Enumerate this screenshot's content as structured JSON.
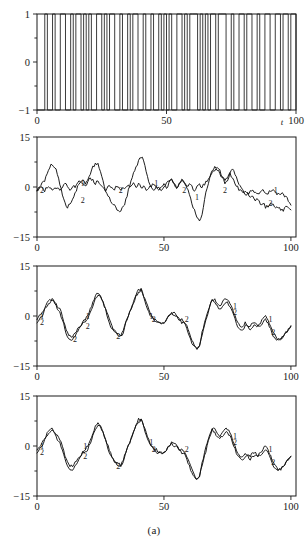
{
  "caption": "(a)",
  "chart_data": [
    {
      "panel": "top",
      "type": "line",
      "title": "",
      "xlabel": "t",
      "ylabel": "",
      "xlim": [
        0,
        100
      ],
      "ylim": [
        -1,
        1
      ],
      "xticks": [
        0,
        50,
        100
      ],
      "xticklabels": [
        "0",
        "50",
        "100"
      ],
      "yticks": [
        -1,
        0,
        1
      ],
      "yticklabels": [
        "-1",
        "0",
        "1"
      ],
      "minor_yticks": [
        -0.5,
        0.5
      ],
      "grid": false,
      "legend": "none",
      "series": [
        {
          "name": "binary input signal",
          "style": "square-wave",
          "x": [
            0,
            3,
            4,
            6,
            7,
            8,
            9,
            11,
            13,
            14,
            15,
            16,
            17,
            18,
            19,
            20,
            21,
            23,
            24,
            25,
            26,
            27,
            28,
            30,
            32,
            33,
            34,
            35,
            36,
            37,
            38,
            39,
            41,
            42,
            44,
            45,
            47,
            48,
            49,
            50,
            51,
            52,
            54,
            56,
            57,
            58,
            59,
            60,
            62,
            63,
            64,
            65,
            66,
            67,
            69,
            70,
            71,
            73,
            75,
            76,
            78,
            80,
            81,
            83,
            85,
            86,
            88,
            90,
            92,
            94,
            95,
            97,
            98,
            100
          ],
          "values": [
            -1,
            1,
            -1,
            1,
            -1,
            -1,
            1,
            -1,
            1,
            -1,
            1,
            1,
            -1,
            1,
            -1,
            1,
            -1,
            1,
            1,
            -1,
            1,
            -1,
            1,
            -1,
            1,
            -1,
            -1,
            1,
            -1,
            1,
            1,
            -1,
            1,
            -1,
            1,
            -1,
            1,
            -1,
            1,
            -1,
            1,
            -1,
            1,
            -1,
            1,
            -1,
            1,
            1,
            -1,
            1,
            -1,
            1,
            -1,
            1,
            -1,
            1,
            1,
            -1,
            1,
            -1,
            1,
            -1,
            1,
            -1,
            1,
            -1,
            1,
            -1,
            1,
            -1,
            1,
            -1,
            1,
            -1
          ]
        }
      ]
    },
    {
      "panel": "second",
      "type": "line",
      "title": "",
      "xlabel": "",
      "ylabel": "",
      "xlim": [
        0,
        102
      ],
      "ylim": [
        -15,
        15
      ],
      "xticks": [
        0,
        50,
        100
      ],
      "xticklabels": [
        "0",
        "50",
        "100"
      ],
      "yticks": [
        -15,
        0,
        15
      ],
      "yticklabels": [
        "-15",
        "0",
        "15"
      ],
      "minor_yticks": [
        -7.5,
        7.5
      ],
      "grid": false,
      "legend": "inline-curve-numbers",
      "annotations": [
        {
          "text": "2",
          "x": 2,
          "y": -1
        },
        {
          "text": "1",
          "x": 18,
          "y": 1
        },
        {
          "text": "2",
          "x": 18,
          "y": -4
        },
        {
          "text": "2",
          "x": 33,
          "y": -1
        },
        {
          "text": "1",
          "x": 47,
          "y": 1
        },
        {
          "text": "2",
          "x": 58,
          "y": -1
        },
        {
          "text": "1",
          "x": 63,
          "y": -3
        },
        {
          "text": "2",
          "x": 74,
          "y": -1
        },
        {
          "text": "1",
          "x": 94,
          "y": -1
        },
        {
          "text": "2",
          "x": 92,
          "y": -5
        }
      ],
      "series": [
        {
          "name": "1",
          "values_at_integer_t": [
            -1,
            0,
            1,
            2,
            4,
            6,
            7,
            6,
            4,
            1,
            -2,
            -5,
            -6,
            -5,
            -4,
            -2,
            0,
            1,
            2,
            1,
            2,
            4,
            6,
            7,
            7,
            5,
            2,
            -1,
            -3,
            -4,
            -5,
            -6,
            -7,
            -7,
            -6,
            -4,
            -1,
            2,
            4,
            6,
            8,
            9,
            8,
            5,
            2,
            0,
            -1,
            0,
            0,
            -1,
            0,
            1,
            2,
            2,
            1,
            0,
            1,
            2,
            1,
            0,
            -2,
            -5,
            -7,
            -9,
            -10,
            -8,
            -4,
            0,
            3,
            5,
            6,
            6,
            5,
            3,
            1,
            2,
            4,
            5,
            4,
            2,
            0,
            -1,
            -2,
            -2,
            -1,
            -1,
            -2,
            -2,
            -1,
            -1,
            -2,
            -2,
            -1,
            -1,
            -2,
            -2,
            -2,
            -2,
            -3,
            -4,
            -5
          ]
        },
        {
          "name": "2",
          "values_at_integer_t": [
            -1,
            0,
            0,
            -1,
            0,
            0,
            -1,
            0,
            0,
            -1,
            0,
            1,
            0,
            -1,
            0,
            0,
            1,
            2,
            1,
            0,
            2,
            3,
            2,
            1,
            2,
            1,
            0,
            -1,
            0,
            0,
            -1,
            0,
            0,
            -1,
            0,
            0,
            1,
            0,
            1,
            0,
            1,
            0,
            0,
            -1,
            0,
            0,
            1,
            0,
            -1,
            0,
            1,
            0,
            1,
            2,
            1,
            0,
            1,
            2,
            1,
            0,
            1,
            0,
            -1,
            0,
            1,
            0,
            1,
            2,
            3,
            4,
            5,
            5,
            4,
            3,
            2,
            3,
            4,
            3,
            1,
            0,
            -1,
            -2,
            -1,
            -2,
            -3,
            -3,
            -4,
            -4,
            -5,
            -5,
            -6,
            -6,
            -5,
            -5,
            -6,
            -6,
            -7,
            -7,
            -6,
            -6,
            -7
          ]
        }
      ]
    },
    {
      "panel": "third",
      "type": "line",
      "title": "",
      "xlabel": "",
      "ylabel": "",
      "xlim": [
        0,
        102
      ],
      "ylim": [
        -15,
        15
      ],
      "xticks": [
        0,
        50,
        100
      ],
      "xticklabels": [
        "0",
        "50",
        "100"
      ],
      "yticks": [
        -15,
        0,
        15
      ],
      "yticklabels": [
        "-15",
        "0",
        "15"
      ],
      "minor_yticks": [
        -7.5,
        7.5
      ],
      "grid": false,
      "legend": "inline-curve-numbers",
      "annotations": [
        {
          "text": "1",
          "x": 2,
          "y": 0
        },
        {
          "text": "2",
          "x": 2,
          "y": -2
        },
        {
          "text": "2",
          "x": 15,
          "y": -7
        },
        {
          "text": "1",
          "x": 20,
          "y": 0
        },
        {
          "text": "2",
          "x": 20,
          "y": -3
        },
        {
          "text": "2",
          "x": 32,
          "y": -6
        },
        {
          "text": "1",
          "x": 45,
          "y": 0
        },
        {
          "text": "2",
          "x": 46,
          "y": -1
        },
        {
          "text": "2",
          "x": 59,
          "y": -1
        },
        {
          "text": "1",
          "x": 78,
          "y": 3
        },
        {
          "text": "2",
          "x": 78,
          "y": 1
        },
        {
          "text": "1",
          "x": 92,
          "y": -1
        },
        {
          "text": "2",
          "x": 93,
          "y": -5
        }
      ],
      "series": [
        {
          "name": "1",
          "values_at_integer_t": [
            -1,
            0,
            1,
            2,
            4,
            5,
            5,
            4,
            3,
            2,
            0,
            -3,
            -5,
            -6,
            -6,
            -5,
            -4,
            -3,
            -2,
            -1,
            0,
            2,
            4,
            6,
            7,
            6,
            4,
            2,
            0,
            -2,
            -4,
            -5,
            -5,
            -6,
            -4,
            -2,
            0,
            2,
            4,
            6,
            8,
            8,
            6,
            4,
            2,
            0,
            -1,
            -1,
            -2,
            -2,
            -2,
            -1,
            0,
            1,
            1,
            0,
            -1,
            -1,
            -2,
            -3,
            -5,
            -7,
            -9,
            -10,
            -9,
            -6,
            -3,
            0,
            3,
            5,
            5,
            4,
            3,
            4,
            5,
            5,
            4,
            2,
            0,
            -2,
            -3,
            -3,
            -2,
            -3,
            -3,
            -2,
            -2,
            -3,
            -2,
            -1,
            0,
            -1,
            -3,
            -5,
            -6,
            -7,
            -7,
            -6,
            -5,
            -4,
            -3
          ]
        },
        {
          "name": "2",
          "values_at_integer_t": [
            -2,
            -1,
            0,
            2,
            3,
            4,
            5,
            4,
            2,
            1,
            -1,
            -4,
            -6,
            -7,
            -7,
            -6,
            -5,
            -3,
            -2,
            -2,
            -1,
            1,
            3,
            5,
            6,
            6,
            4,
            2,
            -1,
            -3,
            -4,
            -5,
            -6,
            -6,
            -5,
            -2,
            0,
            2,
            4,
            6,
            7,
            8,
            6,
            3,
            1,
            0,
            -1,
            -2,
            -2,
            -2,
            -2,
            -1,
            0,
            1,
            0,
            0,
            -1,
            -2,
            -2,
            -4,
            -6,
            -8,
            -9,
            -10,
            -9,
            -5,
            -2,
            1,
            3,
            5,
            4,
            3,
            2,
            3,
            4,
            4,
            3,
            1,
            -1,
            -3,
            -4,
            -4,
            -3,
            -3,
            -4,
            -3,
            -3,
            -3,
            -3,
            -2,
            -1,
            -2,
            -4,
            -6,
            -7,
            -7,
            -7,
            -6,
            -5,
            -4,
            -3
          ]
        }
      ]
    },
    {
      "panel": "fourth",
      "type": "line",
      "title": "",
      "xlabel": "",
      "ylabel": "",
      "xlim": [
        0,
        102
      ],
      "ylim": [
        -15,
        15
      ],
      "xticks": [
        0,
        50,
        100
      ],
      "xticklabels": [
        "0",
        "50",
        "100"
      ],
      "yticks": [
        -15,
        0,
        15
      ],
      "yticklabels": [
        "-15",
        "0",
        "15"
      ],
      "minor_yticks": [
        -7.5,
        7.5
      ],
      "grid": false,
      "legend": "inline-curve-numbers",
      "annotations": [
        {
          "text": "1",
          "x": 2,
          "y": 0
        },
        {
          "text": "2",
          "x": 2,
          "y": -2
        },
        {
          "text": "1",
          "x": 19,
          "y": 0
        },
        {
          "text": "2",
          "x": 19,
          "y": -3
        },
        {
          "text": "2",
          "x": 32,
          "y": -6
        },
        {
          "text": "1",
          "x": 45,
          "y": 1
        },
        {
          "text": "2",
          "x": 46,
          "y": -1
        },
        {
          "text": "2",
          "x": 59,
          "y": -1
        },
        {
          "text": "1",
          "x": 78,
          "y": 3
        },
        {
          "text": "2",
          "x": 78,
          "y": 1
        },
        {
          "text": "1",
          "x": 92,
          "y": -1
        },
        {
          "text": "2",
          "x": 93,
          "y": -5
        }
      ],
      "series": [
        {
          "name": "1",
          "values_at_integer_t": [
            -1,
            0,
            1,
            2,
            4,
            5,
            5,
            4,
            3,
            2,
            0,
            -3,
            -5,
            -6,
            -6,
            -5,
            -4,
            -3,
            -2,
            -1,
            0,
            2,
            4,
            6,
            7,
            6,
            4,
            2,
            0,
            -2,
            -4,
            -5,
            -5,
            -6,
            -4,
            -2,
            0,
            2,
            4,
            6,
            8,
            8,
            6,
            4,
            2,
            0,
            -1,
            -1,
            -2,
            -2,
            -2,
            -1,
            0,
            1,
            1,
            0,
            -1,
            -1,
            -2,
            -3,
            -5,
            -7,
            -9,
            -10,
            -9,
            -6,
            -3,
            0,
            3,
            5,
            5,
            4,
            3,
            4,
            5,
            5,
            4,
            2,
            0,
            -2,
            -3,
            -3,
            -2,
            -3,
            -3,
            -2,
            -2,
            -3,
            -2,
            -1,
            0,
            -1,
            -3,
            -5,
            -6,
            -7,
            -7,
            -6,
            -5,
            -4,
            -3
          ]
        },
        {
          "name": "2",
          "values_at_integer_t": [
            -2,
            -1,
            0,
            2,
            3,
            4,
            5,
            4,
            2,
            1,
            -1,
            -4,
            -6,
            -7,
            -7,
            -6,
            -5,
            -3,
            -2,
            -2,
            -1,
            1,
            3,
            5,
            6,
            6,
            4,
            2,
            -1,
            -3,
            -4,
            -5,
            -6,
            -6,
            -5,
            -2,
            0,
            2,
            4,
            6,
            7,
            8,
            6,
            3,
            1,
            0,
            -1,
            -2,
            -2,
            -2,
            -2,
            -1,
            0,
            1,
            0,
            0,
            -1,
            -2,
            -2,
            -4,
            -6,
            -8,
            -9,
            -10,
            -9,
            -5,
            -2,
            1,
            3,
            5,
            4,
            3,
            2,
            3,
            4,
            4,
            3,
            1,
            -1,
            -3,
            -4,
            -4,
            -3,
            -3,
            -4,
            -3,
            -3,
            -3,
            -3,
            -2,
            -1,
            -2,
            -4,
            -6,
            -7,
            -7,
            -7,
            -6,
            -5,
            -4,
            -3
          ]
        }
      ]
    }
  ]
}
